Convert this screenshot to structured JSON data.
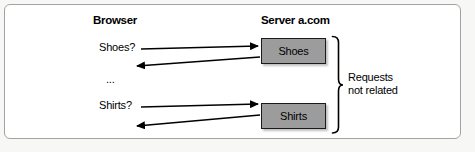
{
  "diagram": {
    "browser_heading": "Browser",
    "server_heading": "Server a.com",
    "requests": [
      {
        "label": "Shoes?",
        "box": "Shoes"
      },
      {
        "label": "Shirts?",
        "box": "Shirts"
      }
    ],
    "ellipsis": "...",
    "annotation": {
      "line1": "Requests",
      "line2": "not related"
    },
    "colors": {
      "box_fill": "#9c9c9c",
      "box_border": "#1a1a1a",
      "arrow": "#000000",
      "frame_border": "#a3a3a3",
      "background": "#ffffff",
      "text": "#000000"
    }
  }
}
